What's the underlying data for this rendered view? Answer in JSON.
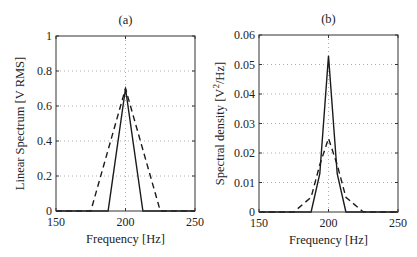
{
  "chart_data": [
    {
      "type": "line",
      "title": "(a)",
      "xlabel": "Frequency [Hz]",
      "ylabel": "Linear Spectrum [V RMS]",
      "xlim": [
        150,
        250
      ],
      "ylim": [
        0,
        1
      ],
      "xticks": [
        "150",
        "200",
        "250"
      ],
      "yticks": [
        "0",
        "0.2",
        "0.4",
        "0.6",
        "0.8",
        "1"
      ],
      "grid": true,
      "series": [
        {
          "name": "solid",
          "style": "solid",
          "x": [
            150,
            187.5,
            200,
            212.5,
            250
          ],
          "y": [
            0,
            0,
            0.7,
            0,
            0
          ]
        },
        {
          "name": "dashed",
          "style": "dashed",
          "x": [
            150,
            175,
            200,
            225,
            250
          ],
          "y": [
            0,
            0,
            0.7,
            0,
            0
          ]
        }
      ]
    },
    {
      "type": "line",
      "title": "(b)",
      "xlabel": "Frequency [Hz]",
      "ylabel": "Spectral density [V²/Hz]",
      "ylabel_main": "Spectral density [V",
      "ylabel_sup": "2",
      "ylabel_tail": "/Hz]",
      "xlim": [
        150,
        250
      ],
      "ylim": [
        0,
        0.06
      ],
      "xticks": [
        "150",
        "200",
        "250"
      ],
      "yticks": [
        "0",
        "0.01",
        "0.02",
        "0.03",
        "0.04",
        "0.05",
        "0.06"
      ],
      "grid": true,
      "series": [
        {
          "name": "solid",
          "style": "solid",
          "x": [
            150,
            187.5,
            193.75,
            200,
            206.25,
            212.5,
            250
          ],
          "y": [
            0,
            0,
            0.013,
            0.053,
            0.013,
            0,
            0
          ]
        },
        {
          "name": "dashed",
          "style": "dashed",
          "x": [
            150,
            175,
            187.5,
            193.75,
            200,
            206.25,
            212.5,
            225,
            250
          ],
          "y": [
            0,
            0,
            0.005,
            0.016,
            0.025,
            0.016,
            0.005,
            0,
            0
          ]
        }
      ]
    }
  ]
}
